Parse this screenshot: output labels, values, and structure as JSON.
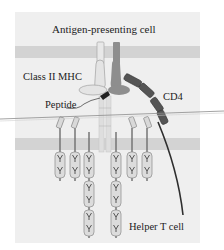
{
  "diagram": {
    "title": "Antigen-presenting cell",
    "labels": {
      "mhc": "Class II MHC",
      "peptide": "Peptide",
      "cd4": "CD4",
      "t_cell": "Helper T cell"
    },
    "colors": {
      "panel": "#efefef",
      "membrane": "#d3d3d3",
      "mhc_alpha": "#e4e4e4",
      "mhc_beta": "#8e8e8e",
      "cd4": "#4a4a4a",
      "ig_domain": "#dcdcdc",
      "stalk": "#6e6e6e"
    },
    "components": [
      "APC membrane",
      "Class II MHC alpha chain",
      "Class II MHC beta chain",
      "Peptide",
      "CD4 coreceptor",
      "T-cell membrane",
      "T-cell receptor / CD3 complex"
    ]
  }
}
